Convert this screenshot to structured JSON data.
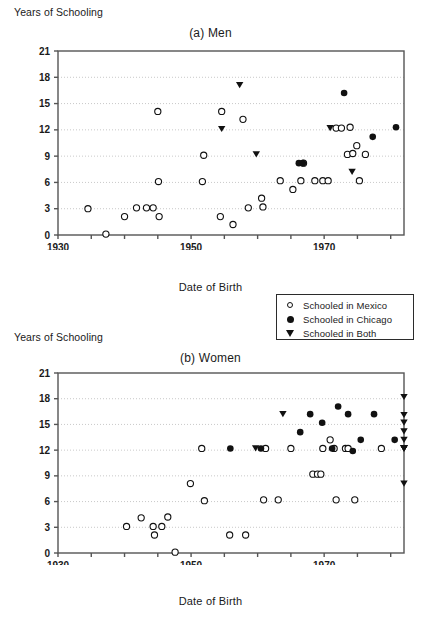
{
  "figure": {
    "y_axis_label": "Years of Schooling",
    "x_axis_label": "Date of Birth"
  },
  "legend": {
    "position": "below-panel-a-right",
    "entries": [
      {
        "marker": "open-circle",
        "label": "Schooled in Mexico"
      },
      {
        "marker": "filled-circle",
        "label": "Schooled in Chicago"
      },
      {
        "marker": "filled-triangle-down",
        "label": "Schooled in Both"
      }
    ]
  },
  "colors": {
    "marker": "#111111",
    "axis": "#555555",
    "grid": "#bbbbbb",
    "background": "#ffffff"
  },
  "chart_data": [
    {
      "type": "scatter",
      "panel": "a",
      "title": "(a) Men",
      "xlabel": "Date of Birth",
      "ylabel": "Years of Schooling",
      "xlim": [
        1930,
        1982
      ],
      "ylim": [
        0,
        21
      ],
      "xticks": [
        1930,
        1935,
        1940,
        1945,
        1950,
        1955,
        1960,
        1965,
        1970,
        1975,
        1980
      ],
      "xticklabels": [
        "1930",
        "",
        "",
        "",
        "1950",
        "",
        "",
        "",
        "1970",
        "",
        ""
      ],
      "yticks": [
        0,
        3,
        6,
        9,
        12,
        15,
        18,
        21
      ],
      "grid": "horizontal-dotted",
      "series": [
        {
          "name": "Schooled in Mexico",
          "marker": "open-circle",
          "points": [
            [
              1934.5,
              3.0
            ],
            [
              1937.2,
              0.1
            ],
            [
              1940.0,
              2.1
            ],
            [
              1941.8,
              3.1
            ],
            [
              1943.3,
              3.1
            ],
            [
              1944.3,
              3.1
            ],
            [
              1945.2,
              2.1
            ],
            [
              1945.1,
              6.1
            ],
            [
              1945.0,
              14.1
            ],
            [
              1951.7,
              6.1
            ],
            [
              1951.9,
              9.1
            ],
            [
              1954.6,
              14.1
            ],
            [
              1954.4,
              2.1
            ],
            [
              1956.3,
              1.2
            ],
            [
              1957.8,
              13.2
            ],
            [
              1958.6,
              3.1
            ],
            [
              1960.6,
              4.2
            ],
            [
              1960.8,
              3.2
            ],
            [
              1963.4,
              6.2
            ],
            [
              1965.3,
              5.2
            ],
            [
              1966.5,
              6.2
            ],
            [
              1966.9,
              8.2
            ],
            [
              1968.6,
              6.2
            ],
            [
              1969.8,
              6.2
            ],
            [
              1970.6,
              6.2
            ],
            [
              1971.8,
              12.2
            ],
            [
              1972.6,
              12.2
            ],
            [
              1973.9,
              12.3
            ],
            [
              1973.5,
              9.2
            ],
            [
              1974.3,
              9.3
            ],
            [
              1974.9,
              10.2
            ],
            [
              1975.3,
              6.2
            ],
            [
              1976.2,
              9.2
            ]
          ]
        },
        {
          "name": "Schooled in Chicago",
          "marker": "filled-circle",
          "points": [
            [
              1966.2,
              8.2
            ],
            [
              1966.8,
              8.2
            ],
            [
              1973.0,
              16.2
            ],
            [
              1977.3,
              11.2
            ],
            [
              1980.8,
              12.3
            ]
          ]
        },
        {
          "name": "Schooled in Both",
          "marker": "filled-triangle-down",
          "points": [
            [
              1954.6,
              12.1
            ],
            [
              1957.3,
              17.1
            ],
            [
              1959.8,
              9.2
            ],
            [
              1970.9,
              12.2
            ],
            [
              1974.2,
              7.2
            ]
          ]
        }
      ]
    },
    {
      "type": "scatter",
      "panel": "b",
      "title": "(b) Women",
      "xlabel": "Date of Birth",
      "ylabel": "Years of Schooling",
      "xlim": [
        1930,
        1982
      ],
      "ylim": [
        0,
        21
      ],
      "xticks": [
        1930,
        1935,
        1940,
        1945,
        1950,
        1955,
        1960,
        1965,
        1970,
        1975,
        1980
      ],
      "xticklabels": [
        "1930",
        "",
        "",
        "",
        "1950",
        "",
        "",
        "",
        "1970",
        "",
        ""
      ],
      "yticks": [
        0,
        3,
        6,
        9,
        12,
        15,
        18,
        21
      ],
      "grid": "horizontal-dotted",
      "series": [
        {
          "name": "Schooled in Mexico",
          "marker": "open-circle",
          "points": [
            [
              1940.3,
              3.1
            ],
            [
              1942.5,
              4.1
            ],
            [
              1944.3,
              3.1
            ],
            [
              1944.5,
              2.1
            ],
            [
              1945.6,
              3.1
            ],
            [
              1946.5,
              4.2
            ],
            [
              1947.6,
              0.1
            ],
            [
              1949.9,
              8.1
            ],
            [
              1951.6,
              12.2
            ],
            [
              1952.0,
              6.1
            ],
            [
              1955.8,
              2.1
            ],
            [
              1958.2,
              2.1
            ],
            [
              1960.9,
              6.2
            ],
            [
              1961.2,
              12.2
            ],
            [
              1963.1,
              6.2
            ],
            [
              1965.0,
              12.2
            ],
            [
              1968.3,
              9.2
            ],
            [
              1969.0,
              9.2
            ],
            [
              1969.5,
              9.2
            ],
            [
              1969.8,
              12.2
            ],
            [
              1970.9,
              13.2
            ],
            [
              1971.5,
              12.2
            ],
            [
              1971.8,
              6.2
            ],
            [
              1973.2,
              12.2
            ],
            [
              1973.6,
              12.2
            ],
            [
              1974.6,
              6.2
            ],
            [
              1978.6,
              12.2
            ]
          ]
        },
        {
          "name": "Schooled in Chicago",
          "marker": "filled-circle",
          "points": [
            [
              1955.9,
              12.2
            ],
            [
              1960.5,
              12.2
            ],
            [
              1966.4,
              14.1
            ],
            [
              1967.9,
              16.2
            ],
            [
              1969.7,
              15.2
            ],
            [
              1971.2,
              12.2
            ],
            [
              1972.1,
              17.1
            ],
            [
              1973.6,
              16.2
            ],
            [
              1974.3,
              11.9
            ],
            [
              1975.5,
              13.2
            ],
            [
              1977.5,
              16.2
            ],
            [
              1980.6,
              13.2
            ]
          ]
        },
        {
          "name": "Schooled in Both",
          "marker": "filled-triangle-down",
          "points": [
            [
              1959.7,
              12.2
            ],
            [
              1963.8,
              16.2
            ],
            [
              1666.0,
              12.2
            ],
            [
              1666.5,
              8.1
            ],
            [
              1667.9,
              18.2
            ],
            [
              1668.5,
              13.2
            ],
            [
              1669.2,
              12.2
            ],
            [
              1670.1,
              12.2
            ],
            [
              1671.4,
              12.2
            ],
            [
              1672.8,
              16.1
            ],
            [
              1679.0,
              14.2
            ],
            [
              1680.8,
              15.2
            ],
            [
              1680.6,
              12.2
            ]
          ]
        }
      ]
    }
  ]
}
